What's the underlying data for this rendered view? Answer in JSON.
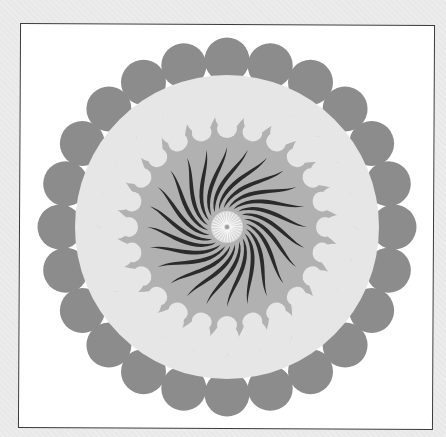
{
  "figure": {
    "center": [
      227,
      227
    ],
    "colors": {
      "page_background": "#ececec",
      "frame_fill": "#ffffff",
      "frame_border": "#3a3a3a",
      "outer_petals": "#8c8c8c",
      "light_ring": "#e6e6e6",
      "mid_ring": "#b1b1b1",
      "spiral_blades": "#2b2b2b",
      "center_disc": "#d8d8d8",
      "center_lines": "#ffffff"
    },
    "outer_petals": {
      "count": 24,
      "ring_radius": 167,
      "petal_radius": 22.5
    },
    "light_ring": {
      "radius": 152
    },
    "inner_bulbs": {
      "count": 24,
      "ring_radius": 112,
      "bulb_rx": 15,
      "bulb_ry": 12,
      "hook_outer_radius": 133
    },
    "mid_ring": {
      "radius": 98
    },
    "spiral_blades": {
      "count": 24,
      "inner_radius": 19,
      "outer_radius": 80,
      "twist_degrees": 55,
      "max_width": 5
    },
    "center_disc": {
      "radius": 16,
      "ray_count": 28
    }
  }
}
